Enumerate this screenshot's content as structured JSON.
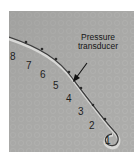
{
  "image": {
    "description": "Grayscale radiograph-style image of a curved catheter with numbered sensor positions",
    "annotation": {
      "line1": "Pressure",
      "line2": "transducer"
    },
    "labels": [
      {
        "text": "8",
        "x": 1,
        "y": 41
      },
      {
        "text": "7",
        "x": 17,
        "y": 50
      },
      {
        "text": "6",
        "x": 31,
        "y": 59
      },
      {
        "text": "5",
        "x": 44,
        "y": 70
      },
      {
        "text": "4",
        "x": 57,
        "y": 83
      },
      {
        "text": "3",
        "x": 69,
        "y": 96
      },
      {
        "text": "2",
        "x": 80,
        "y": 110
      },
      {
        "text": "1",
        "x": 96,
        "y": 125
      }
    ],
    "colors": {
      "background": "#a9a9a7",
      "catheter": "#3a3a3a",
      "catheter_highlight": "#e0e0e0",
      "text": "#1e1e1e"
    }
  }
}
